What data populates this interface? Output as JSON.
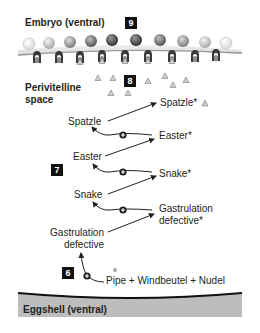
{
  "title_top": "Embryo (ventral)",
  "title_bottom": "Eggshell (ventral)",
  "region_label": "Perivitelline space",
  "region_label_lines": [
    "Perivitelline",
    "space"
  ],
  "steps": [
    {
      "id": "step-9",
      "number": "9"
    },
    {
      "id": "step-8",
      "number": "8"
    },
    {
      "id": "step-7",
      "number": "7"
    },
    {
      "id": "step-6",
      "number": "6"
    }
  ],
  "cascade": {
    "inactive": [
      "Spatzle",
      "Easter",
      "Snake",
      "Gastrulation defective"
    ],
    "active": [
      "Spatzle*",
      "Easter*",
      "Snake*",
      "Gastrulation defective*"
    ],
    "activator_complex": "Pipe + Windbeutel + Nudel"
  },
  "labels": {
    "spatzle": "Spatzle",
    "spatzle_active": "Spatzle*",
    "easter": "Easter",
    "easter_active": "Easter*",
    "snake": "Snake",
    "snake_active": "Snake*",
    "gd_line1": "Gastrulation",
    "gd_line2": "defective",
    "gd_active_line1": "Gastrulation",
    "gd_active_line2": "defective*",
    "activator": "Pipe + Windbeutel + Nudel"
  },
  "colors": {
    "eggshell": "#bdbdbd",
    "membrane": "#9a9a9a",
    "badge": "#111111",
    "text": "#231f20"
  }
}
